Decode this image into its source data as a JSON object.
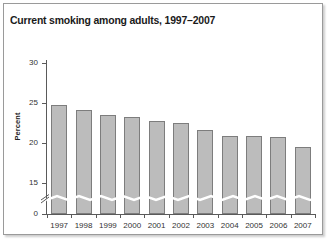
{
  "figure": {
    "title": "Current smoking among adults, 1997–2007",
    "background_color": "#ffffff",
    "border_color": "#9a9a9a"
  },
  "axis_break": {
    "present": "true",
    "symbol_name": "axis-break-zigzag",
    "between": "0 and 15"
  },
  "style": {
    "bar_fill": "#bcbcbc",
    "bar_outline": "#7d7d7d",
    "axis_color": "#5a5a5a",
    "text_color": "#333333",
    "title_color": "#1a1a1a"
  },
  "chart_data": {
    "type": "bar",
    "title": "Current smoking among adults, 1997–2007",
    "xlabel": "",
    "ylabel": "Percent",
    "categories": [
      "1997",
      "1998",
      "1999",
      "2000",
      "2001",
      "2002",
      "2003",
      "2004",
      "2005",
      "2006",
      "2007"
    ],
    "values": [
      24.7,
      24.1,
      23.5,
      23.3,
      22.8,
      22.5,
      21.6,
      20.9,
      20.9,
      20.8,
      19.5
    ],
    "ylim": [
      0,
      30
    ],
    "yticks": [
      0,
      15,
      20,
      25,
      30
    ],
    "ytick_labels": [
      "0",
      "15",
      "20",
      "25",
      "30"
    ],
    "y_axis_broken": true,
    "y_break_range": [
      0,
      15
    ],
    "grid": false,
    "legend": "none"
  }
}
